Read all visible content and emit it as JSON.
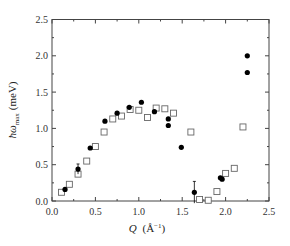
{
  "chart_data": {
    "type": "scatter",
    "title": "",
    "xlabel": "Q (Å⁻¹)",
    "ylabel": "ħω_max (meV)",
    "xlim": [
      0.0,
      2.5
    ],
    "ylim": [
      0.0,
      2.5
    ],
    "x_ticks": [
      "0.0",
      "0.5",
      "1.0",
      "1.5",
      "2.0",
      "2.5"
    ],
    "y_ticks": [
      "0.0",
      "0.5",
      "1.0",
      "1.5",
      "2.0",
      "2.5"
    ],
    "grid": false,
    "legend": null,
    "series": [
      {
        "name": "filled circles",
        "marker": "filled-circle",
        "color": "#000000",
        "points": [
          {
            "x": 0.15,
            "y": 0.16
          },
          {
            "x": 0.3,
            "y": 0.44,
            "err": 0.07
          },
          {
            "x": 0.44,
            "y": 0.73
          },
          {
            "x": 0.61,
            "y": 1.1
          },
          {
            "x": 0.75,
            "y": 1.21
          },
          {
            "x": 0.89,
            "y": 1.29
          },
          {
            "x": 1.03,
            "y": 1.36
          },
          {
            "x": 1.18,
            "y": 1.23
          },
          {
            "x": 1.34,
            "y": 1.13
          },
          {
            "x": 1.34,
            "y": 1.04
          },
          {
            "x": 1.49,
            "y": 0.74
          },
          {
            "x": 1.64,
            "y": 0.12,
            "err": 0.15
          },
          {
            "x": 1.94,
            "y": 0.32
          },
          {
            "x": 1.96,
            "y": 0.3
          },
          {
            "x": 2.25,
            "y": 2.0
          },
          {
            "x": 2.25,
            "y": 1.77
          }
        ]
      },
      {
        "name": "open squares",
        "marker": "open-square",
        "color": "#555555",
        "points": [
          {
            "x": 0.11,
            "y": 0.12
          },
          {
            "x": 0.2,
            "y": 0.23
          },
          {
            "x": 0.3,
            "y": 0.37
          },
          {
            "x": 0.4,
            "y": 0.55
          },
          {
            "x": 0.5,
            "y": 0.75
          },
          {
            "x": 0.6,
            "y": 0.95
          },
          {
            "x": 0.7,
            "y": 1.13
          },
          {
            "x": 0.8,
            "y": 1.17
          },
          {
            "x": 0.9,
            "y": 1.26
          },
          {
            "x": 1.0,
            "y": 1.25
          },
          {
            "x": 1.1,
            "y": 1.15
          },
          {
            "x": 1.2,
            "y": 1.28
          },
          {
            "x": 1.3,
            "y": 1.27
          },
          {
            "x": 1.4,
            "y": 1.21
          },
          {
            "x": 1.6,
            "y": 0.95
          },
          {
            "x": 1.7,
            "y": 0.02
          },
          {
            "x": 1.8,
            "y": 0.01
          },
          {
            "x": 1.9,
            "y": 0.13
          },
          {
            "x": 2.0,
            "y": 0.38
          },
          {
            "x": 2.1,
            "y": 0.45
          },
          {
            "x": 2.2,
            "y": 1.02
          }
        ]
      }
    ]
  },
  "axes": {
    "x_label_main": "Q",
    "x_label_unit": "(Å",
    "x_label_sup": "−1",
    "x_label_close": ")",
    "y_label_main": "ħω",
    "y_label_sub": "max",
    "y_label_unit": "(meV)"
  },
  "colors": {
    "axis": "#444444",
    "filled": "#000000",
    "open": "#666666"
  }
}
